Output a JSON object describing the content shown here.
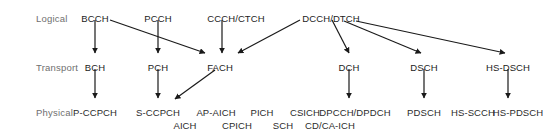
{
  "diagram": {
    "colors": {
      "background": "#ffffff",
      "text": "#1c1c1c",
      "row_label_text": "#6f6f6f",
      "arrow": "#1a1a1a"
    },
    "row_labels": [
      {
        "label": "Logical",
        "x": 36,
        "y": 13
      },
      {
        "label": "Transport",
        "x": 36,
        "y": 62
      },
      {
        "label": "Physical",
        "x": 36,
        "y": 107
      }
    ],
    "logical_channels": [
      {
        "id": "BCCH",
        "label": "BCCH",
        "x": 95,
        "y": 13
      },
      {
        "id": "PCCH",
        "label": "PCCH",
        "x": 158,
        "y": 13
      },
      {
        "id": "CCCH_CTCH",
        "label": "CCCH/CTCH",
        "x": 236,
        "y": 13
      },
      {
        "id": "DCCH_DTCH",
        "label": "DCCH/DTCH",
        "x": 331,
        "y": 13
      }
    ],
    "transport_channels": [
      {
        "id": "BCH",
        "label": "BCH",
        "x": 95,
        "y": 62
      },
      {
        "id": "PCH",
        "label": "PCH",
        "x": 158,
        "y": 62
      },
      {
        "id": "FACH",
        "label": "FACH",
        "x": 220,
        "y": 62
      },
      {
        "id": "DCH",
        "label": "DCH",
        "x": 349,
        "y": 62
      },
      {
        "id": "DSCH",
        "label": "DSCH",
        "x": 424,
        "y": 62
      },
      {
        "id": "HS_DSCH",
        "label": "HS-DSCH",
        "x": 508,
        "y": 62
      }
    ],
    "physical_channels_row1": [
      {
        "id": "P_CCPCH",
        "label": "P-CCPCH",
        "x": 95,
        "y": 107
      },
      {
        "id": "S_CCPCH",
        "label": "S-CCPCH",
        "x": 158,
        "y": 107
      },
      {
        "id": "AP_AICH",
        "label": "AP-AICH",
        "x": 216,
        "y": 107
      },
      {
        "id": "PICH",
        "label": "PICH",
        "x": 262,
        "y": 107
      },
      {
        "id": "CSICH",
        "label": "CSICH",
        "x": 305,
        "y": 107
      },
      {
        "id": "DPCCH_DPDCH",
        "label": "DPCCH/DPDCH",
        "x": 355,
        "y": 107
      },
      {
        "id": "PDSCH",
        "label": "PDSCH",
        "x": 424,
        "y": 107
      },
      {
        "id": "HS_SCCH",
        "label": "HS-SCCH",
        "x": 473,
        "y": 107
      },
      {
        "id": "HS_PDSCH",
        "label": "HS-PDSCH",
        "x": 518,
        "y": 107
      }
    ],
    "physical_channels_row2": [
      {
        "id": "AICH",
        "label": "AICH",
        "x": 185,
        "y": 120
      },
      {
        "id": "CPICH",
        "label": "CPICH",
        "x": 237,
        "y": 120
      },
      {
        "id": "SCH",
        "label": "SCH",
        "x": 283,
        "y": 120
      },
      {
        "id": "CD_CA_ICH",
        "label": "CD/CA-ICH",
        "x": 330,
        "y": 120
      }
    ],
    "arrows": [
      {
        "id": "bcch-to-bch",
        "from": "BCCH",
        "to": "BCH",
        "x1": 95,
        "y1": 20,
        "x2": 95,
        "y2": 53
      },
      {
        "id": "bcch-to-fach",
        "from": "BCCH",
        "to": "FACH",
        "x1": 110,
        "y1": 20,
        "x2": 205,
        "y2": 53
      },
      {
        "id": "pcch-to-pch",
        "from": "PCCH",
        "to": "PCH",
        "x1": 158,
        "y1": 20,
        "x2": 158,
        "y2": 53
      },
      {
        "id": "ccch-to-fach",
        "from": "CCCH/CTCH",
        "to": "FACH",
        "x1": 222,
        "y1": 20,
        "x2": 222,
        "y2": 53
      },
      {
        "id": "dcch-to-fach",
        "from": "DCCH/DTCH",
        "to": "FACH",
        "x1": 300,
        "y1": 20,
        "x2": 238,
        "y2": 53
      },
      {
        "id": "dcch-to-dch",
        "from": "DCCH/DTCH",
        "to": "DCH",
        "x1": 332,
        "y1": 20,
        "x2": 349,
        "y2": 53
      },
      {
        "id": "dcch-to-dsch",
        "from": "DCCH/DTCH",
        "to": "DSCH",
        "x1": 344,
        "y1": 21,
        "x2": 421,
        "y2": 53
      },
      {
        "id": "dcch-to-hs-dsch",
        "from": "DCCH/DTCH",
        "to": "HS-DSCH",
        "x1": 356,
        "y1": 21,
        "x2": 505,
        "y2": 53
      },
      {
        "id": "bch-to-p-ccpch",
        "from": "BCH",
        "to": "P-CCPCH",
        "x1": 95,
        "y1": 69,
        "x2": 95,
        "y2": 98
      },
      {
        "id": "pch-to-s-ccpch",
        "from": "PCH",
        "to": "S-CCPCH",
        "x1": 158,
        "y1": 69,
        "x2": 158,
        "y2": 98
      },
      {
        "id": "fach-to-s-ccpch",
        "from": "FACH",
        "to": "S-CCPCH",
        "x1": 215,
        "y1": 70,
        "x2": 175,
        "y2": 99
      },
      {
        "id": "dch-to-dpcch",
        "from": "DCH",
        "to": "DPCCH/DPDCH",
        "x1": 349,
        "y1": 69,
        "x2": 349,
        "y2": 98
      },
      {
        "id": "dsch-to-pdsch",
        "from": "DSCH",
        "to": "PDSCH",
        "x1": 424,
        "y1": 69,
        "x2": 424,
        "y2": 98
      },
      {
        "id": "hs-dsch-to-hs-pdsch",
        "from": "HS-DSCH",
        "to": "HS-PDSCH",
        "x1": 508,
        "y1": 69,
        "x2": 508,
        "y2": 98
      }
    ]
  }
}
